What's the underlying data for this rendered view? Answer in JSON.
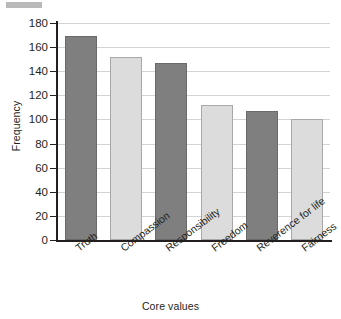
{
  "chart_data": {
    "type": "bar",
    "title": "",
    "xlabel": "Core values",
    "ylabel": "Frequency",
    "categories": [
      "Truth",
      "Compassion",
      "Responsibility",
      "Freedom",
      "Reverence for life",
      "Fairness"
    ],
    "values": [
      169,
      152,
      147,
      112,
      107,
      100
    ],
    "ylim": [
      0,
      180
    ],
    "yticks": [
      0,
      20,
      40,
      60,
      80,
      100,
      120,
      140,
      160,
      180
    ],
    "ytick_labels": [
      "0",
      "20",
      "40",
      "60",
      "80",
      "100",
      "120",
      "140",
      "160",
      "180"
    ],
    "grid": true,
    "legend": false,
    "bar_colors": [
      "#7f7f7f",
      "#dcdcdc",
      "#7f7f7f",
      "#dcdcdc",
      "#7f7f7f",
      "#dcdcdc"
    ],
    "series": [
      {
        "name": "Frequency",
        "values": [
          169,
          152,
          147,
          112,
          107,
          100
        ]
      }
    ],
    "colors": {
      "bar_dark": "#7f7f7f",
      "bar_light": "#dcdcdc",
      "gridline": "#d3d3d3",
      "axis": "#231f20",
      "text": "#231f20",
      "background": "#ffffff"
    }
  }
}
